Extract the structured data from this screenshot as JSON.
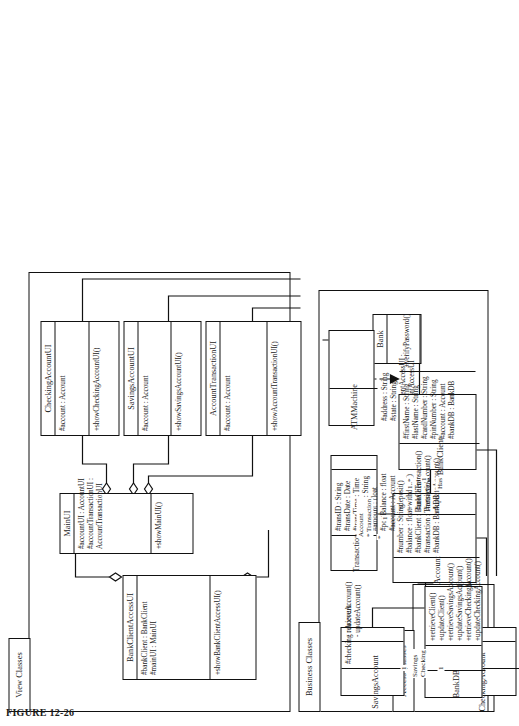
{
  "figure": {
    "caption": "FIGURE 12-26"
  },
  "packages": [
    {
      "id": "view",
      "label": "View Classes"
    },
    {
      "id": "business",
      "label": "Business Classes"
    },
    {
      "id": "access",
      "label": "Access Classes"
    }
  ],
  "classes": [
    {
      "id": "bankClientAccessUI",
      "name": "BankClientAccessUI",
      "attributes": [
        "#bankClient : BankClient",
        "#mainUI : MainUI"
      ],
      "operations": [
        "+showBankClientAccessUI()"
      ]
    },
    {
      "id": "mainUI",
      "name": "MainUI",
      "attributes": [
        "#accountUI : AccountUI",
        "#accountTransactionUI :",
        "AccountTransactionUI"
      ],
      "operations": [
        "+showMainUI()"
      ]
    },
    {
      "id": "accountTransactionUI",
      "name": "AccountTransactionUI",
      "attributes": [
        "#account : Account"
      ],
      "operations": [
        "+showAccountTransactionUI()"
      ]
    },
    {
      "id": "savingsAccountUI",
      "name": "SavingsAccountUI",
      "attributes": [
        "#account : Account"
      ],
      "operations": [
        "+showSavingsAccountUI()"
      ]
    },
    {
      "id": "checkingAccountUI",
      "name": "CheckingAccountUI",
      "attributes": [
        "#account : Account"
      ],
      "operations": [
        "+showCheckingAccountUI()"
      ]
    },
    {
      "id": "bank",
      "name": "Bank",
      "attributes": [],
      "operations": []
    },
    {
      "id": "atmMachine",
      "name": "ATMMachine",
      "attributes": [
        "#address : String",
        "#state : String",
        "#bankClientAccessUI :",
        "BankClientAccessUI"
      ],
      "operations": []
    },
    {
      "id": "bankClient",
      "name": "BankClient",
      "attributes": [
        "#firstName : String",
        "#lastName : String",
        "#cardNumber : String",
        "#pinNumber : String",
        "#account : Account",
        "#bankDB : BankDB"
      ],
      "operations": [
        "+verifyPassword()"
      ]
    },
    {
      "id": "account",
      "name": "Account",
      "attributes": [
        "#number : String",
        "#balance : float",
        "#bankClient : BankClient",
        "#transaction : Transaction",
        "#bankDB : BankDB"
      ],
      "operations": [
        "+deposit()",
        "+withdraw()",
        "#createTransaction()",
        "#retrieveAccount()",
        "#updateAccount()"
      ]
    },
    {
      "id": "transaction",
      "name": "Transaction",
      "attributes": [
        "#transID : String",
        "#transDate : Date",
        "#transTime : Time",
        "#transType : String",
        "#amount : float",
        "#postBalance : float",
        "#account : Account"
      ],
      "operations": []
    },
    {
      "id": "savingsAccount",
      "name": "SavingsAccount",
      "attributes": [
        "#checking : Account"
      ],
      "operations": [
        "- retrieveAccount()",
        "- updateAccount()"
      ]
    },
    {
      "id": "checkingAccount",
      "name": "CheckingAccount",
      "attributes": [
        "#savings : Account"
      ],
      "operations": [
        "+withdraw()",
        "- retrieveAccount()",
        "- updateAccount()"
      ]
    },
    {
      "id": "bankDB",
      "name": "BankDB",
      "attributes": [],
      "operations": [
        "+retrieveClient()",
        "+updateClient()",
        "+retrieveSavingsAccount()",
        "+updateSavingsAccount()",
        "+retrieveCheckingAccount()",
        "+updateCheckingAccount()"
      ]
    }
  ],
  "association_labels": [
    {
      "id": "has",
      "text": "Has"
    },
    {
      "id": "account-trans",
      "text": "Account\n* Transaction"
    },
    {
      "id": "savings-check",
      "text": "Savings\nChecking"
    }
  ],
  "multiplicities": [
    {
      "id": "bankclient-one",
      "text": "1"
    },
    {
      "id": "account-many",
      "text": "1..*"
    },
    {
      "id": "account-one",
      "text": "1"
    },
    {
      "id": "trans-many",
      "text": "*"
    },
    {
      "id": "savings-one",
      "text": "1"
    },
    {
      "id": "checking-one",
      "text": "1"
    }
  ]
}
